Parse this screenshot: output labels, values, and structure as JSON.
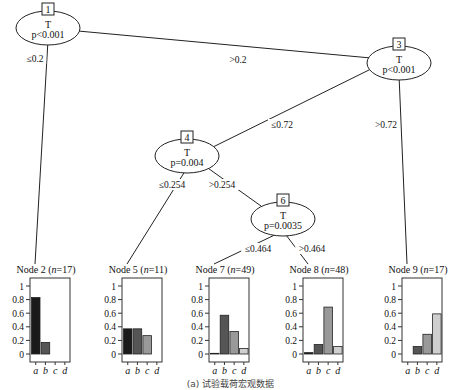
{
  "figure": {
    "caption": "(a) 试验载荷宏观数据"
  },
  "colors": {
    "a": "#1a1a1a",
    "b": "#555555",
    "c": "#999999",
    "d": "#cfcfcf",
    "line": "#222222"
  },
  "inner_nodes": [
    {
      "id": "1",
      "variable": "T",
      "p": "p<0.001",
      "cx": 48,
      "cy": 25
    },
    {
      "id": "3",
      "variable": "T",
      "p": "p<0.001",
      "cx": 399,
      "cy": 60
    },
    {
      "id": "4",
      "variable": "T",
      "p": "p=0.004",
      "cx": 187,
      "cy": 153
    },
    {
      "id": "6",
      "variable": "T",
      "p": "p=0.0035",
      "cx": 283,
      "cy": 216
    }
  ],
  "edges": [
    {
      "from": "1",
      "to": "2",
      "label": "≤0.2",
      "lx": 35,
      "ly": 62
    },
    {
      "from": "1",
      "to": "3",
      "label": ">0.2",
      "lx": 238,
      "ly": 63
    },
    {
      "from": "3",
      "to": "4",
      "label": "≤0.72",
      "lx": 282,
      "ly": 128
    },
    {
      "from": "3",
      "to": "9",
      "label": ">0.72",
      "lx": 386,
      "ly": 128
    },
    {
      "from": "4",
      "to": "5",
      "label": "≤0.254",
      "lx": 172,
      "ly": 188
    },
    {
      "from": "4",
      "to": "6",
      "label": ">0.254",
      "lx": 222,
      "ly": 188
    },
    {
      "from": "6",
      "to": "7",
      "label": "≤0.464",
      "lx": 258,
      "ly": 252
    },
    {
      "from": "6",
      "to": "8",
      "label": ">0.464",
      "lx": 312,
      "ly": 252
    }
  ],
  "terminal_nodes": [
    {
      "id": "2",
      "label": "Node 2",
      "n": "17",
      "x": 30,
      "values": [
        0.83,
        0.17,
        0,
        0
      ]
    },
    {
      "id": "5",
      "label": "Node 5",
      "n": "11",
      "x": 122,
      "values": [
        0.37,
        0.37,
        0.27,
        0
      ]
    },
    {
      "id": "7",
      "label": "Node 7",
      "n": "49",
      "x": 209,
      "values": [
        0.01,
        0.57,
        0.33,
        0.08
      ]
    },
    {
      "id": "8",
      "label": "Node 8",
      "n": "48",
      "x": 303,
      "values": [
        0.02,
        0.14,
        0.69,
        0.11
      ]
    },
    {
      "id": "9",
      "label": "Node 9",
      "n": "17",
      "x": 402,
      "values": [
        0,
        0.11,
        0.29,
        0.59
      ]
    }
  ],
  "axis": {
    "ticks": [
      "0",
      "0.2",
      "0.4",
      "0.6",
      "0.8",
      "1"
    ],
    "categories": [
      "a",
      "b",
      "c",
      "d"
    ]
  },
  "chart_data": {
    "type": "bar",
    "categories": [
      "a",
      "b",
      "c",
      "d"
    ],
    "ylim": [
      0,
      1
    ],
    "series": [
      {
        "name": "Node 2 (n=17)",
        "values": [
          0.83,
          0.17,
          0,
          0
        ]
      },
      {
        "name": "Node 5 (n=11)",
        "values": [
          0.37,
          0.37,
          0.27,
          0
        ]
      },
      {
        "name": "Node 7 (n=49)",
        "values": [
          0.01,
          0.57,
          0.33,
          0.08
        ]
      },
      {
        "name": "Node 8 (n=48)",
        "values": [
          0.02,
          0.14,
          0.69,
          0.11
        ]
      },
      {
        "name": "Node 9 (n=17)",
        "values": [
          0,
          0.11,
          0.29,
          0.59
        ]
      }
    ]
  }
}
